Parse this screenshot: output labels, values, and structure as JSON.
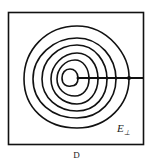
{
  "diagram": {
    "field_label": "E",
    "field_subscript": "⊥",
    "caption": "D",
    "contours": 6,
    "stroke_color": "#111111"
  }
}
